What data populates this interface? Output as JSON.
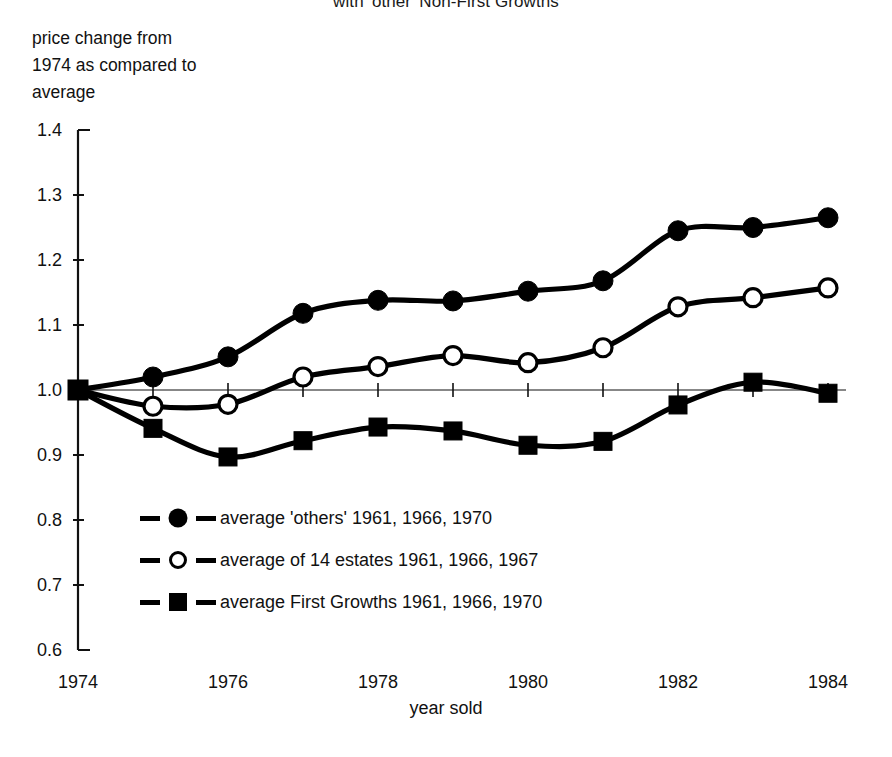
{
  "chart_title": "with 'other' Non-First Growths",
  "y_axis_caption": {
    "line1": "price change from",
    "line2": "1974 as compared to",
    "line3": "average"
  },
  "x_axis_title": "year sold",
  "axis": {
    "y_ticks": [
      "1.4",
      "1.3",
      "1.2",
      "1.1",
      "1.0",
      "0.9",
      "0.8",
      "0.7",
      "0.6"
    ],
    "x_ticks": [
      "1974",
      "1976",
      "1978",
      "1980",
      "1982",
      "1984"
    ]
  },
  "legend": {
    "items": [
      {
        "marker": "circle-filled",
        "label": "average 'others' 1961, 1966, 1970"
      },
      {
        "marker": "circle-open",
        "label": "average of 14 estates 1961, 1966, 1967"
      },
      {
        "marker": "square-filled",
        "label": "average First Growths 1961, 1966, 1970"
      }
    ]
  },
  "chart_data": {
    "type": "line",
    "title": "with 'other' Non-First Growths",
    "xlabel": "year sold",
    "ylabel": "price change from 1974 as compared to average",
    "xlim": [
      1974,
      1984
    ],
    "ylim": [
      0.6,
      1.4
    ],
    "ytick_values": [
      1.4,
      1.3,
      1.2,
      1.1,
      1.0,
      0.9,
      0.8,
      0.7,
      0.6
    ],
    "xtick_values": [
      1974,
      1976,
      1978,
      1980,
      1982,
      1984
    ],
    "grid": false,
    "legend_position": "inside-lower-left",
    "x": [
      1974,
      1975,
      1976,
      1977,
      1978,
      1979,
      1980,
      1981,
      1982,
      1983,
      1984
    ],
    "series": [
      {
        "name": "average 'others' 1961, 1966, 1970",
        "marker": "circle-filled",
        "values": [
          1.0,
          1.02,
          1.051,
          1.118,
          1.138,
          1.137,
          1.152,
          1.168,
          1.245,
          1.25,
          1.265
        ]
      },
      {
        "name": "average of 14 estates 1961, 1966, 1967",
        "marker": "circle-open",
        "values": [
          1.0,
          0.975,
          0.978,
          1.02,
          1.036,
          1.053,
          1.042,
          1.065,
          1.128,
          1.142,
          1.157
        ]
      },
      {
        "name": "average First Growths 1961, 1966, 1970",
        "marker": "square-filled",
        "values": [
          1.0,
          0.941,
          0.897,
          0.922,
          0.943,
          0.937,
          0.915,
          0.921,
          0.977,
          1.012,
          0.995
        ]
      }
    ]
  },
  "colors": {
    "ink": "#000000",
    "background": "#ffffff"
  }
}
